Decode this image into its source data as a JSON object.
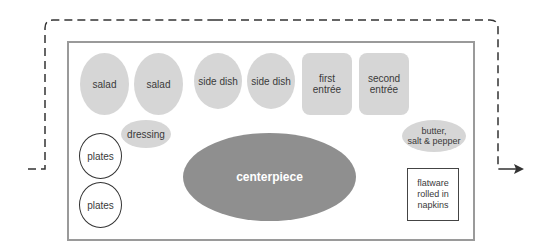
{
  "diagram": {
    "type": "buffet-table-layout",
    "flow": {
      "style": "dashed",
      "direction": "enters left, loops over top, exits right",
      "arrow_icon": "arrow-right"
    },
    "items": [
      {
        "id": "salad-1",
        "label": "salad",
        "shape": "oval",
        "fill": "#d6d6d6"
      },
      {
        "id": "salad-2",
        "label": "salad",
        "shape": "oval",
        "fill": "#d6d6d6"
      },
      {
        "id": "side-dish-1",
        "label": "side dish",
        "shape": "oval",
        "fill": "#d6d6d6"
      },
      {
        "id": "side-dish-2",
        "label": "side dish",
        "shape": "oval",
        "fill": "#d6d6d6"
      },
      {
        "id": "first-entree",
        "label": "first entrée",
        "line1": "first",
        "line2": "entrée",
        "shape": "rounded-rect",
        "fill": "#d6d6d6"
      },
      {
        "id": "second-entree",
        "label": "second entrée",
        "line1": "second",
        "line2": "entrée",
        "shape": "rounded-rect",
        "fill": "#d6d6d6"
      },
      {
        "id": "dressing",
        "label": "dressing",
        "shape": "oval",
        "fill": "#d6d6d6"
      },
      {
        "id": "butter-salt-pepper",
        "label": "butter, salt & pepper",
        "line1": "butter,",
        "line2": "salt & pepper",
        "shape": "oval",
        "fill": "#d6d6d6"
      },
      {
        "id": "plates-1",
        "label": "plates",
        "shape": "circle-outline",
        "fill": "#ffffff"
      },
      {
        "id": "plates-2",
        "label": "plates",
        "shape": "circle-outline",
        "fill": "#ffffff"
      },
      {
        "id": "centerpiece",
        "label": "centerpiece",
        "shape": "oval",
        "fill": "#8f8f8f"
      },
      {
        "id": "flatware",
        "label": "flatware rolled in napkins",
        "line1": "flatware",
        "line2": "rolled in",
        "line3": "napkins",
        "shape": "rect-outline",
        "fill": "#ffffff"
      }
    ],
    "colors": {
      "table_border": "#9a9a9a",
      "light_dish": "#d6d6d6",
      "centerpiece": "#8f8f8f",
      "flow_line": "#333333"
    }
  }
}
